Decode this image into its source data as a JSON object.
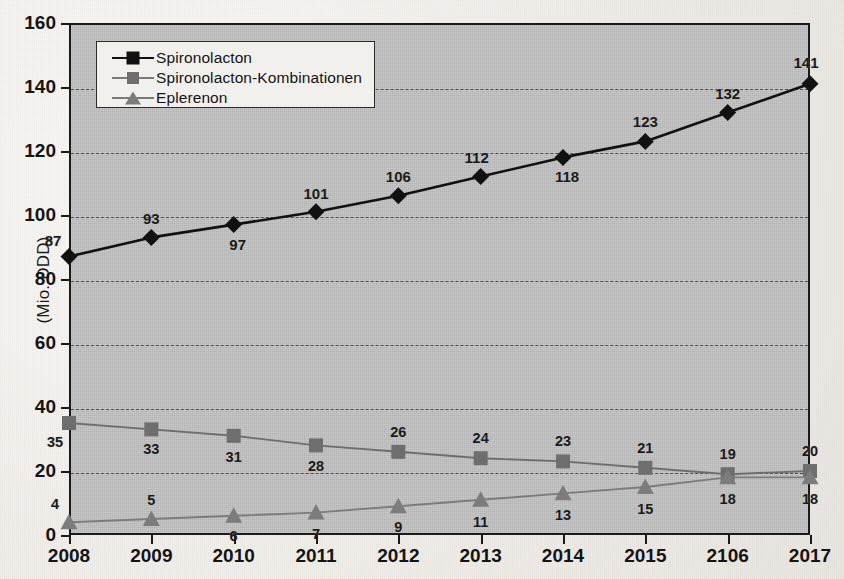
{
  "chart_data": {
    "type": "line",
    "title": "",
    "subtitle": "",
    "xlabel": "",
    "ylabel": "(Mio. DDD)",
    "categories": [
      "2008",
      "2009",
      "2010",
      "2011",
      "2012",
      "2013",
      "2014",
      "2015",
      "2106",
      "2017"
    ],
    "x": [
      2008,
      2009,
      2010,
      2011,
      2012,
      2013,
      2014,
      2015,
      2016,
      2017
    ],
    "ylim": [
      0,
      160
    ],
    "ytick_step": 20,
    "yticks": [
      "0",
      "20",
      "40",
      "60",
      "80",
      "100",
      "120",
      "140",
      "160"
    ],
    "grid": "horizontal-dashed",
    "legend_position": "top-left-inside",
    "series": [
      {
        "name": "Spironolacton",
        "marker": "diamond",
        "color": "#111111",
        "values": [
          87,
          93,
          97,
          101,
          106,
          112,
          118,
          123,
          132,
          141
        ],
        "labels": [
          "87",
          "93",
          "97",
          "101",
          "106",
          "112",
          "118",
          "123",
          "132",
          "141"
        ]
      },
      {
        "name": "Spironolacton-Kombinationen",
        "marker": "square",
        "color": "#6e6e6e",
        "values": [
          35,
          33,
          31,
          28,
          26,
          24,
          23,
          21,
          19,
          20
        ],
        "labels": [
          "35",
          "33",
          "31",
          "28",
          "26",
          "24",
          "23",
          "21",
          "19",
          "20"
        ]
      },
      {
        "name": "Eplerenon",
        "marker": "triangle",
        "color": "#7c7c7c",
        "values": [
          4,
          5,
          6,
          7,
          9,
          11,
          13,
          15,
          18,
          18
        ],
        "labels": [
          "4",
          "5",
          "6",
          "7",
          "9",
          "11",
          "13",
          "15",
          "18",
          "18"
        ]
      }
    ]
  },
  "legend": {
    "items": [
      {
        "label": "Spironolacton",
        "marker": "diamond-icon"
      },
      {
        "label": "Spironolacton-Kombinationen",
        "marker": "square-icon"
      },
      {
        "label": "Eplerenon",
        "marker": "triangle-icon"
      }
    ]
  },
  "axes": {
    "y_title": "(Mio. DDD)",
    "y_ticks": [
      "160",
      "140",
      "120",
      "100",
      "80",
      "60",
      "40",
      "20",
      "0"
    ],
    "x_ticks": [
      "2008",
      "2009",
      "2010",
      "2011",
      "2012",
      "2013",
      "2014",
      "2015",
      "2106",
      "2017"
    ]
  }
}
